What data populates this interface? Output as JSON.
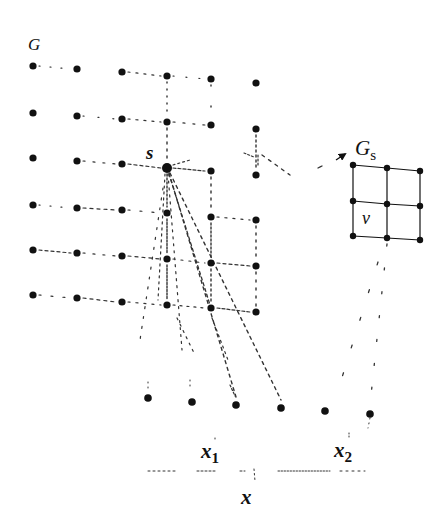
{
  "labels": {
    "graph": "G",
    "source": "s",
    "subgraph": "G",
    "subgraph_sub": "s",
    "vertex": "v",
    "x1": "x",
    "x1_sub": "1",
    "x2": "x",
    "x2_sub": "2",
    "x": "x"
  },
  "colors": {
    "ink": "#111111",
    "dash": "#333333",
    "background": "#ffffff"
  },
  "grid_G": {
    "columns_x": [
      33,
      77,
      122,
      167,
      211,
      256
    ],
    "rows_y": [
      [
        66,
        69,
        72,
        76,
        79,
        83
      ],
      [
        113,
        116,
        119,
        122,
        125,
        129
      ],
      [
        158,
        161,
        164,
        168,
        171,
        175
      ],
      [
        205,
        208,
        210,
        213,
        217,
        220
      ],
      [
        250,
        253,
        256,
        259,
        263,
        266
      ],
      [
        295,
        298,
        302,
        305,
        308,
        312
      ]
    ],
    "source_node": {
      "row": 2,
      "col": 3
    }
  },
  "grid_Gs": {
    "points": [
      [
        [
          353,
          165
        ],
        [
          387,
          168
        ],
        [
          420,
          171
        ]
      ],
      [
        [
          353,
          201
        ],
        [
          387,
          204
        ],
        [
          420,
          206
        ]
      ],
      [
        [
          353,
          236
        ],
        [
          387,
          238
        ],
        [
          420,
          240
        ]
      ]
    ]
  },
  "bottom_row": [
    [
      148,
      398
    ],
    [
      192,
      402
    ],
    [
      236,
      405
    ],
    [
      281,
      408
    ],
    [
      325,
      411
    ],
    [
      370,
      414
    ]
  ],
  "axis": {
    "x_start": 148,
    "x_end": 365,
    "y": 471
  }
}
